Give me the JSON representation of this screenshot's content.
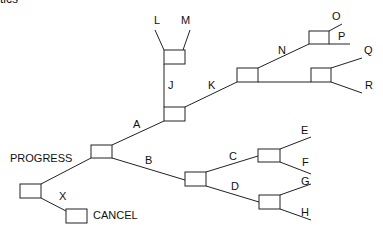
{
  "header_fragment": "tics",
  "diagram": {
    "type": "decision-tree",
    "root": {
      "branches": [
        {
          "label": "PROGRESS",
          "node": "progress"
        },
        {
          "label": "X",
          "outcome": "CANCEL"
        }
      ]
    },
    "labels": {
      "progress": "PROGRESS",
      "cancel": "CANCEL",
      "x": "X",
      "a": "A",
      "b": "B",
      "c": "C",
      "d": "D",
      "e": "E",
      "f": "F",
      "g": "G",
      "h": "H",
      "j": "J",
      "k": "K",
      "l": "L",
      "m": "M",
      "n": "N",
      "o": "O",
      "p": "P",
      "q": "Q",
      "r": "R"
    },
    "edges": [
      {
        "from": "root",
        "to": "progress",
        "label": ""
      },
      {
        "from": "root",
        "to": "cancel",
        "label": "X"
      },
      {
        "from": "progress",
        "to": "A",
        "label": "A"
      },
      {
        "from": "progress",
        "to": "B",
        "label": "B"
      },
      {
        "from": "A",
        "to": "J",
        "label": "J"
      },
      {
        "from": "A",
        "to": "K",
        "label": "K"
      },
      {
        "from": "J",
        "to": "L",
        "label": "L"
      },
      {
        "from": "J",
        "to": "M",
        "label": "M"
      },
      {
        "from": "K",
        "to": "N",
        "label": "N"
      },
      {
        "from": "K",
        "to": "QR",
        "label": ""
      },
      {
        "from": "N",
        "to": "O",
        "label": "O"
      },
      {
        "from": "N",
        "to": "P",
        "label": "P"
      },
      {
        "from": "QR",
        "to": "Q",
        "label": "Q"
      },
      {
        "from": "QR",
        "to": "R",
        "label": "R"
      },
      {
        "from": "B",
        "to": "C",
        "label": "C"
      },
      {
        "from": "B",
        "to": "D",
        "label": "D"
      },
      {
        "from": "C",
        "to": "E",
        "label": "E"
      },
      {
        "from": "C",
        "to": "F",
        "label": "F"
      },
      {
        "from": "D",
        "to": "G",
        "label": "G"
      },
      {
        "from": "D",
        "to": "H",
        "label": "H"
      }
    ]
  }
}
